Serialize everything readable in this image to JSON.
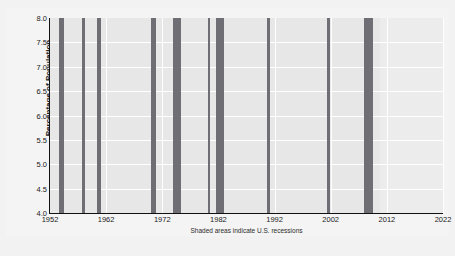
{
  "figure": {
    "clipped_title": "",
    "background_color": "#f2f2f2",
    "plot_background_color": "#e8e8e8",
    "gridline_color": "#ffffff",
    "line_color": "#1a1a1a",
    "recession_band_color": "#6e6e74",
    "footnote": "Shaded areas indicate U.S. recessions"
  },
  "chart_data": {
    "type": "line",
    "title": "",
    "xlabel": "",
    "ylabel": "Percentage of Population",
    "xlim": [
      1952,
      2022
    ],
    "ylim": [
      4.0,
      8.0
    ],
    "grid": true,
    "legend": null,
    "yticks": [
      "8.0",
      "7.5",
      "7.0",
      "6.5",
      "6.0",
      "5.5",
      "5.0",
      "4.5",
      "4.0"
    ],
    "ytick_values": [
      8.0,
      7.5,
      7.0,
      6.5,
      6.0,
      5.5,
      5.0,
      4.5,
      4.0
    ],
    "xticks": [
      "1952",
      "1962",
      "1972",
      "1982",
      "1992",
      "2002",
      "2012",
      "2022"
    ],
    "xtick_values": [
      1952,
      1962,
      1972,
      1982,
      1992,
      2002,
      2012,
      2022
    ],
    "series": [
      {
        "name": "Percentage of Population",
        "x": [
          1952.0,
          1952.5,
          1953.0,
          1953.3,
          1953.7,
          1954.0,
          1954.5,
          1955.0,
          1955.5,
          1956.0,
          1956.5,
          1957.0,
          1957.5,
          1958.0,
          1958.5,
          1959.0,
          1959.5,
          1960.0,
          1960.5,
          1961.0,
          1961.5,
          1962.0,
          1962.5,
          1963.0,
          1963.5,
          1964.0,
          1964.5,
          1965.0,
          1965.5,
          1966.0,
          1966.5,
          1967.0,
          1967.5,
          1968.0,
          1968.5,
          1969.0,
          1969.5,
          1970.0,
          1970.5,
          1971.0,
          1971.5,
          1972.0,
          1972.5,
          1973.0,
          1973.5,
          1974.0,
          1974.5,
          1975.0,
          1975.5,
          1976.0,
          1976.5,
          1977.0,
          1977.5,
          1978.0,
          1978.5,
          1979.0,
          1979.5,
          1980.0,
          1980.5,
          1981.0,
          1981.5,
          1982.0,
          1982.5,
          1983.0,
          1983.5,
          1984.0,
          1984.5,
          1985.0,
          1985.5,
          1986.0,
          1986.5,
          1987.0,
          1987.5,
          1988.0,
          1988.5,
          1989.0,
          1989.5,
          1990.0,
          1990.5,
          1991.0,
          1991.5,
          1992.0,
          1992.5,
          1993.0,
          1993.5,
          1994.0,
          1994.5,
          1995.0,
          1995.5,
          1996.0,
          1996.5,
          1997.0,
          1997.5,
          1998.0,
          1998.5,
          1999.0,
          1999.5,
          2000.0,
          2000.5,
          2001.0,
          2001.5,
          2002.0,
          2002.5,
          2003.0,
          2003.5,
          2004.0,
          2004.5,
          2005.0,
          2005.5,
          2006.0,
          2006.5,
          2007.0,
          2007.5,
          2008.0,
          2008.5,
          2009.0,
          2009.5,
          2010.0,
          2010.5,
          2011.0,
          2011.5,
          2012.0,
          2012.5,
          2013.0,
          2013.5,
          2014.0,
          2014.5,
          2015.0
        ],
        "y": [
          4.25,
          4.2,
          4.27,
          4.4,
          4.25,
          4.17,
          4.18,
          4.2,
          4.22,
          4.24,
          4.28,
          4.3,
          4.32,
          4.33,
          4.36,
          4.4,
          4.45,
          4.52,
          4.6,
          4.7,
          4.76,
          4.68,
          4.7,
          4.74,
          4.78,
          4.83,
          4.88,
          4.93,
          5.0,
          5.07,
          5.14,
          5.22,
          5.3,
          5.4,
          5.5,
          5.62,
          5.75,
          5.88,
          6.0,
          6.08,
          6.14,
          6.18,
          6.22,
          6.21,
          6.26,
          6.34,
          6.42,
          6.5,
          6.58,
          6.66,
          6.74,
          6.82,
          6.88,
          6.9,
          6.89,
          6.91,
          6.93,
          6.96,
          7.0,
          7.08,
          7.16,
          7.26,
          7.3,
          7.16,
          7.08,
          7.02,
          6.97,
          6.92,
          6.88,
          6.84,
          6.82,
          6.8,
          6.84,
          6.88,
          6.93,
          6.98,
          7.03,
          7.09,
          7.14,
          7.19,
          7.24,
          7.29,
          7.34,
          7.45,
          7.34,
          7.33,
          7.33,
          7.34,
          7.33,
          7.32,
          7.31,
          7.31,
          7.3,
          7.29,
          7.27,
          7.24,
          7.22,
          7.2,
          7.21,
          7.28,
          7.4,
          7.51,
          7.38,
          7.41,
          7.44,
          7.47,
          7.45,
          7.44,
          7.42,
          7.41,
          7.4,
          7.39,
          7.38,
          7.38,
          7.37,
          7.36,
          7.35,
          7.36,
          7.38,
          7.48,
          7.34,
          7.22,
          7.12,
          7.04,
          6.99,
          6.95,
          6.93,
          6.93
        ]
      }
    ],
    "recessions": [
      {
        "start": 1953.58,
        "end": 1954.42
      },
      {
        "start": 1957.67,
        "end": 1958.33
      },
      {
        "start": 1960.33,
        "end": 1961.17
      },
      {
        "start": 1969.92,
        "end": 1970.92
      },
      {
        "start": 1973.92,
        "end": 1975.25
      },
      {
        "start": 1980.08,
        "end": 1980.58
      },
      {
        "start": 1981.58,
        "end": 1982.92
      },
      {
        "start": 1990.58,
        "end": 1991.25
      },
      {
        "start": 2001.25,
        "end": 2001.92
      },
      {
        "start": 2007.92,
        "end": 2009.5
      }
    ]
  }
}
